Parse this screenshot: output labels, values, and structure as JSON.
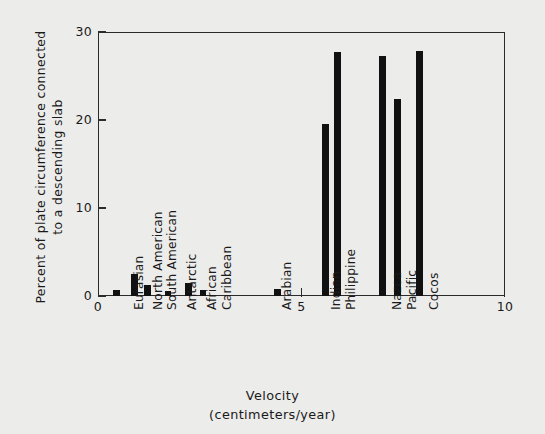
{
  "chart_data": {
    "type": "bar",
    "title": "",
    "xlabel": "Velocity (centimeters/year)",
    "ylabel": "Percent of plate circumference connected to a descending slab",
    "ylabel_lines": [
      "Percent of plate circumference connected",
      "to a descending slab"
    ],
    "xlabel_lines": [
      "Velocity",
      "(centimeters/year)"
    ],
    "xlim": [
      0,
      10
    ],
    "ylim": [
      0,
      30
    ],
    "xticks": [
      0,
      5,
      10
    ],
    "xtick_labels": [
      "0",
      "5",
      "10"
    ],
    "yticks": [
      0,
      10,
      20,
      30
    ],
    "ytick_labels": [
      "0",
      "10",
      "20",
      "30"
    ],
    "grid": false,
    "legend": "none",
    "bar_color": "#111111",
    "background_color": "#ececea",
    "axis_color": "#2b2b2b",
    "categories": [
      "Eurasian",
      "North American",
      "South American",
      "Antarctic",
      "African",
      "Caribbean",
      "Arabian",
      "Indian",
      "Philippine",
      "Nazca",
      "Pacific",
      "Cocos"
    ],
    "points": [
      {
        "label": "Eurasian",
        "x": 0.45,
        "value": 0.7
      },
      {
        "label": "North American",
        "x": 0.9,
        "value": 2.5
      },
      {
        "label": "South American",
        "x": 1.22,
        "value": 1.3
      },
      {
        "label": "Antarctic",
        "x": 1.72,
        "value": 0.6
      },
      {
        "label": "African",
        "x": 2.22,
        "value": 1.5
      },
      {
        "label": "Caribbean",
        "x": 2.58,
        "value": 0.7
      },
      {
        "label": "Arabian",
        "x": 4.4,
        "value": 0.8
      },
      {
        "label": "Indian",
        "x": 5.58,
        "value": 19.5
      },
      {
        "label": "Philippine",
        "x": 5.88,
        "value": 27.7
      },
      {
        "label": "Nazca",
        "x": 7.0,
        "value": 27.3
      },
      {
        "label": "Pacific",
        "x": 7.36,
        "value": 22.4
      },
      {
        "label": "Cocos",
        "x": 7.9,
        "value": 27.8
      }
    ]
  },
  "figure": {
    "bar_width_units": 0.17,
    "category_label_positions": [
      {
        "label": "Eurasian",
        "left": 133,
        "top": 310
      },
      {
        "label": "North American",
        "left": 152,
        "top": 310
      },
      {
        "label": "South American",
        "left": 166,
        "top": 310
      },
      {
        "label": "Antarctic",
        "left": 186,
        "top": 310
      },
      {
        "label": "African",
        "left": 206,
        "top": 310
      },
      {
        "label": "Caribbean",
        "left": 221,
        "top": 310
      },
      {
        "label": "Arabian",
        "left": 281,
        "top": 310
      },
      {
        "label": "Indian",
        "left": 330,
        "top": 310
      },
      {
        "label": "Philippine",
        "left": 345,
        "top": 310
      },
      {
        "label": "Nazca",
        "left": 391,
        "top": 310
      },
      {
        "label": "Pacific",
        "left": 406,
        "top": 310
      },
      {
        "label": "Cocos",
        "left": 428,
        "top": 310
      }
    ]
  }
}
